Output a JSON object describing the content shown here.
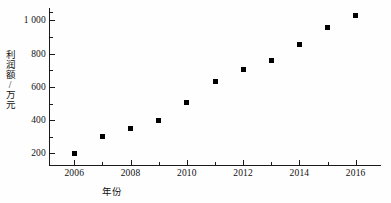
{
  "chart_data": {
    "type": "scatter",
    "title": "",
    "xlabel": "年份",
    "ylabel": "利润额/万元",
    "xlim": [
      2005.1,
      2016.9
    ],
    "ylim": [
      130,
      1075
    ],
    "grid": false,
    "legend": "none",
    "marker": "filled-square",
    "marker_color": "#000000",
    "x": [
      2006,
      2007,
      2008,
      2009,
      2010,
      2011,
      2012,
      2013,
      2014,
      2015,
      2016
    ],
    "values": [
      200,
      300,
      352,
      400,
      505,
      633,
      705,
      758,
      853,
      955,
      1028
    ],
    "xticks": [
      2006,
      2008,
      2010,
      2012,
      2014,
      2016
    ],
    "xtick_labels": [
      "2006",
      "2008",
      "2010",
      "2012",
      "2014",
      "2016"
    ],
    "xminor_ticks": [
      2007,
      2009,
      2011,
      2013,
      2015
    ],
    "yticks": [
      200,
      400,
      600,
      800,
      1000
    ],
    "ytick_labels": [
      "200",
      "400",
      "600",
      "800",
      "1 000"
    ],
    "yminor_ticks": [
      300,
      500,
      700,
      900,
      1050
    ]
  },
  "axes": {
    "y_title": "利润额/万元",
    "x_title": "年份"
  }
}
